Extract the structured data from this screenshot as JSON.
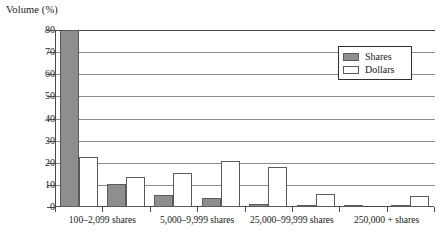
{
  "chart_data": {
    "type": "bar",
    "title": "",
    "ylabel": "Volume (%)",
    "xlabel": "",
    "ylim": [
      0,
      80
    ],
    "yticks": [
      0,
      10,
      20,
      30,
      40,
      50,
      60,
      70,
      80
    ],
    "grid": true,
    "legend_position": "top-right",
    "categories": [
      "100–2,099 shares",
      "",
      "5,000–9,999 shares",
      "",
      "25,000–99,999 shares",
      "",
      "250,000 + shares",
      ""
    ],
    "visible_tick_labels": [
      "100–2,099 shares",
      "5,000–9,999 shares",
      "25,000–99,999 shares",
      "250,000 + shares"
    ],
    "series": [
      {
        "name": "Shares",
        "color": "#8e8e8e",
        "values": [
          80,
          10.5,
          5.5,
          4,
          1.5,
          0.4,
          0.6,
          0.5
        ]
      },
      {
        "name": "Dollars",
        "color": "#ffffff",
        "values": [
          22.5,
          13.5,
          15.5,
          21,
          18,
          6,
          0,
          5
        ]
      }
    ]
  },
  "legend": {
    "items": [
      {
        "label": "Shares",
        "swatch": "shares"
      },
      {
        "label": "Dollars",
        "swatch": "dollars"
      }
    ]
  },
  "axis": {
    "y_title": "Volume (%)"
  }
}
